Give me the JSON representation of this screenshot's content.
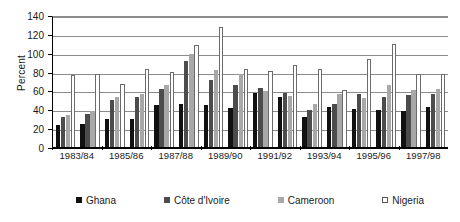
{
  "chart_data": {
    "type": "bar",
    "title": "",
    "xlabel": "",
    "ylabel": "Percent",
    "ylim": [
      0,
      140
    ],
    "yticks": [
      0,
      20,
      40,
      60,
      80,
      100,
      120,
      140
    ],
    "grid": true,
    "legend_position": "bottom",
    "categories": [
      "1983/84",
      "1984/85",
      "1985/86",
      "1986/87",
      "1987/88",
      "1988/89",
      "1989/90",
      "1990/91",
      "1991/92",
      "1992/93",
      "1993/94",
      "1994/95",
      "1995/96",
      "1996/97",
      "1997/98",
      "1998/99"
    ],
    "axis_labels": [
      "1983/84",
      "1985/86",
      "1987/88",
      "1989/90",
      "1991/92",
      "1993/94",
      "1995/96",
      "1997/98"
    ],
    "series": [
      {
        "name": "Ghana",
        "color": "#111111",
        "values": [
          24,
          26,
          31,
          31,
          46,
          47,
          46,
          42,
          58,
          54,
          33,
          43,
          41,
          40,
          39,
          44
        ]
      },
      {
        "name": "Côte d'Ivoire",
        "color": "#4c4c4c",
        "values": [
          33,
          36,
          51,
          54,
          63,
          92,
          72,
          67,
          64,
          58,
          40,
          47,
          57,
          54,
          56,
          57
        ]
      },
      {
        "name": "Cameroon",
        "color": "#a8a8a8",
        "values": [
          35,
          39,
          54,
          57,
          67,
          100,
          83,
          79,
          60,
          55,
          47,
          57,
          53,
          67,
          62,
          63
        ]
      },
      {
        "name": "Nigeria",
        "color": "#ffffff",
        "values": [
          77,
          78,
          68,
          84,
          81,
          109,
          128,
          84,
          82,
          88,
          84,
          62,
          94,
          110,
          79,
          79
        ]
      }
    ]
  },
  "legend": {
    "items": [
      {
        "label": "Ghana"
      },
      {
        "label": "Côte d'Ivoire"
      },
      {
        "label": "Cameroon"
      },
      {
        "label": "Nigeria"
      }
    ]
  }
}
